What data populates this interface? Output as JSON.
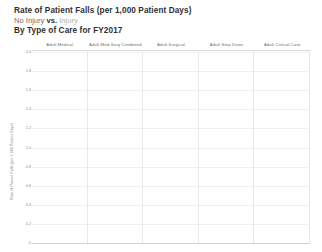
{
  "header": {
    "title": "Rate of Patient Falls (per 1,000 Patient Days)",
    "subtitle_part1": "No Injury",
    "subtitle_vs": "vs.",
    "subtitle_part2": "Injury",
    "subtitle_full": "No Injury vs. Injury",
    "title_line3": "By Type of Care for FY2017"
  },
  "colors": {
    "no_injury": "#6e6e6e",
    "injury": "#a9a9a9",
    "gridline": "#e8e8e8",
    "axis": "#cfcfcf",
    "text": "#2f2f2f",
    "muted_text": "#8a8a8a",
    "background": "#ffffff"
  },
  "chart_data": {
    "type": "bar",
    "title": "Rate of Patient Falls (per 1,000 Patient Days)",
    "subtitle": "No Injury vs. Injury",
    "subtitle2": "By Type of Care for FY2017",
    "xlabel": "",
    "ylabel": "Rate of Patient Falls (per 1,000 Patient Days)",
    "ylim": [
      0,
      2.0
    ],
    "yticks": [
      0.0,
      0.2,
      0.4,
      0.6,
      0.8,
      1.0,
      1.2,
      1.4,
      1.6,
      1.8,
      2.0
    ],
    "ytick_labels": [
      "0",
      "0.2",
      "0.4",
      "0.6",
      "0.8",
      "1.0",
      "1.2",
      "1.4",
      "1.6",
      "1.8",
      "2.0"
    ],
    "grid": true,
    "legend_position": "subtitle",
    "layout": "small-multiples-panels",
    "categories": [
      "Adult Medical",
      "Adult Med-Surg Combined",
      "Adult Surgical",
      "Adult Step Down",
      "Adult Critical Care"
    ],
    "series": [
      {
        "name": "No Injury",
        "color": "#6e6e6e",
        "values": [
          1.98,
          1.8,
          0.94,
          0.4,
          0.52
        ]
      },
      {
        "name": "Injury",
        "color": "#a9a9a9",
        "values": [
          0.78,
          0.68,
          0.38,
          0.62,
          0.29
        ]
      }
    ]
  },
  "panels": [
    {
      "label": "Adult Medical",
      "bars": [
        {
          "series": "No Injury",
          "value": 1.98,
          "pct": 99.0
        },
        {
          "series": "Injury",
          "value": 0.78,
          "pct": 39.0
        }
      ]
    },
    {
      "label": "Adult Med-Surg Combined",
      "bars": [
        {
          "series": "No Injury",
          "value": 1.8,
          "pct": 90.0
        },
        {
          "series": "Injury",
          "value": 0.68,
          "pct": 34.0
        }
      ]
    },
    {
      "label": "Adult Surgical",
      "bars": [
        {
          "series": "No Injury",
          "value": 0.94,
          "pct": 47.0
        },
        {
          "series": "Injury",
          "value": 0.38,
          "pct": 19.0
        }
      ]
    },
    {
      "label": "Adult Step Down",
      "bars": [
        {
          "series": "No Injury",
          "value": 0.4,
          "pct": 20.0
        },
        {
          "series": "Injury",
          "value": 0.62,
          "pct": 31.0
        }
      ]
    },
    {
      "label": "Adult Critical Care",
      "bars": [
        {
          "series": "No Injury",
          "value": 0.52,
          "pct": 26.0
        },
        {
          "series": "Injury",
          "value": 0.29,
          "pct": 14.5
        }
      ]
    }
  ]
}
